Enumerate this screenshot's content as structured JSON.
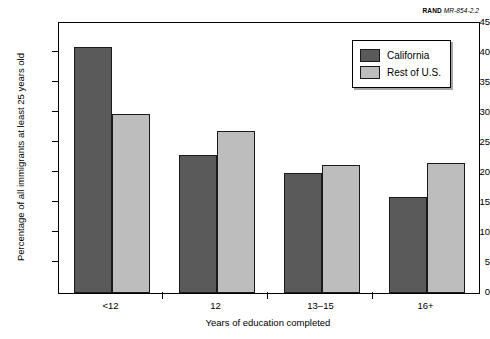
{
  "source_credit": {
    "mark": "RAND",
    "document": "MR-854-2.2"
  },
  "legend": {
    "position": "top-right",
    "entries": [
      {
        "label": "California",
        "color": "#5a5a5a"
      },
      {
        "label": "Rest of U.S.",
        "color": "#bdbdbd"
      }
    ]
  },
  "chart_data": {
    "type": "bar",
    "title": "",
    "subtitle": "",
    "categories": [
      "<12",
      "12",
      "13–15",
      "16+"
    ],
    "series": [
      {
        "name": "California",
        "color": "#5a5a5a",
        "values": [
          41,
          23,
          20,
          16
        ]
      },
      {
        "name": "Rest of U.S.",
        "color": "#bdbdbd",
        "values": [
          29.8,
          27,
          21.3,
          21.7
        ]
      }
    ],
    "xlabel": "Years of education completed",
    "ylabel": "Percentage of all immigrants at least 25 years old",
    "ylim": [
      0,
      45
    ],
    "ytick_labels": [
      "0",
      "5",
      "10",
      "15",
      "20",
      "25",
      "30",
      "35",
      "40",
      "45"
    ],
    "ytick_values": [
      0,
      5,
      10,
      15,
      20,
      25,
      30,
      35,
      40,
      45
    ],
    "grid": false,
    "legend_position": "top-right"
  }
}
